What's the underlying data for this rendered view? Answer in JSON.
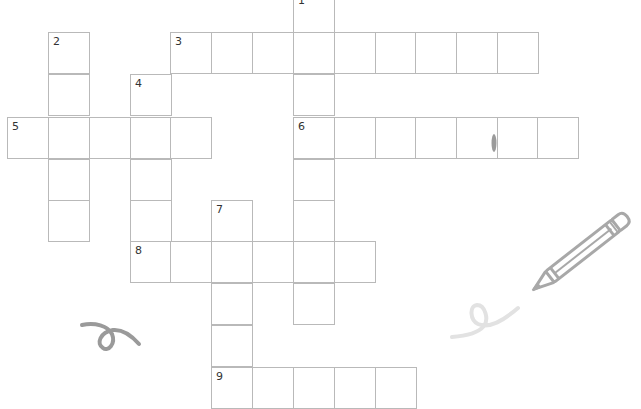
{
  "puzzle": {
    "cell_size": 41,
    "col_x": [
      7,
      48,
      89,
      130,
      170,
      211,
      252,
      293,
      334,
      375,
      415,
      456,
      497,
      537
    ],
    "row_y": [
      -9,
      32,
      74,
      117,
      159,
      200,
      241,
      283,
      325,
      367
    ],
    "words": [
      {
        "number": "1",
        "direction": "down",
        "col": 7,
        "row": 0,
        "length": 8
      },
      {
        "number": "2",
        "direction": "down",
        "col": 1,
        "row": 1,
        "length": 5
      },
      {
        "number": "3",
        "direction": "across",
        "col": 4,
        "row": 1,
        "length": 9
      },
      {
        "number": "4",
        "direction": "down",
        "col": 3,
        "row": 2,
        "length": 5
      },
      {
        "number": "5",
        "direction": "across",
        "col": 0,
        "row": 3,
        "length": 5
      },
      {
        "number": "6",
        "direction": "across",
        "col": 7,
        "row": 3,
        "length": 7
      },
      {
        "number": "7",
        "direction": "down",
        "col": 5,
        "row": 5,
        "length": 5
      },
      {
        "number": "8",
        "direction": "across",
        "col": 3,
        "row": 6,
        "length": 6
      },
      {
        "number": "9",
        "direction": "across",
        "col": 5,
        "row": 9,
        "length": 5
      }
    ]
  },
  "colors": {
    "grid_line": "#b9b9b9",
    "number_text": "#333333",
    "doodle": "#9a9a9a",
    "doodle_light": "#dedede",
    "pencil": "#a8a8a8"
  },
  "decorations": [
    "curl-doodle-icon",
    "pencil-icon",
    "squiggle-doodle-icon",
    "smudge-mark"
  ]
}
